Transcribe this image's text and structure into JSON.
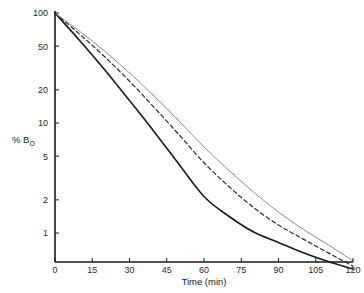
{
  "chart_data": {
    "type": "line",
    "title": "",
    "subtitle": "",
    "xlabel": "Time (min)",
    "ylabel": "% B",
    "ylabel_subscript": "O",
    "ylabel_full": "% B_O",
    "yscale": "log",
    "xscale": "linear",
    "xlim": [
      0,
      120
    ],
    "ylim": [
      0.45,
      100
    ],
    "grid": false,
    "legend": "none",
    "xticks": [
      0,
      15,
      30,
      45,
      60,
      75,
      90,
      105,
      120
    ],
    "xticklabels": [
      "0",
      "15",
      "30",
      "45",
      "60",
      "75",
      "90",
      "105",
      "120"
    ],
    "yticks": [
      100,
      50,
      20,
      10,
      5,
      2,
      1
    ],
    "yticklabels": [
      "100",
      "50",
      "20",
      "10",
      "5",
      "2",
      "1"
    ],
    "x": [
      0,
      10,
      20,
      30,
      40,
      50,
      60,
      70,
      80,
      90,
      100,
      110,
      120
    ],
    "series": [
      {
        "name": "curve-fast",
        "style": "solid",
        "color": "#1a1a1a",
        "width": 1.6,
        "values": [
          100,
          56,
          30.5,
          16.0,
          8.3,
          4.2,
          2.15,
          1.42,
          1.02,
          0.82,
          0.66,
          0.55,
          0.47
        ]
      },
      {
        "name": "curve-medium",
        "style": "dashed",
        "color": "#2b2b2b",
        "width": 1.2,
        "values": [
          100,
          64,
          40.0,
          24.0,
          13.8,
          7.8,
          4.35,
          2.65,
          1.7,
          1.18,
          0.88,
          0.66,
          0.5
        ]
      },
      {
        "name": "curve-slow",
        "style": "solid",
        "color": "#8a8a8a",
        "width": 1.0,
        "values": [
          100,
          68,
          45.0,
          28.5,
          17.5,
          10.4,
          6.05,
          3.72,
          2.35,
          1.55,
          1.08,
          0.78,
          0.56
        ]
      }
    ],
    "annotations": []
  },
  "axes": {
    "x_axis_name": "x-axis",
    "y_axis_name": "y-axis"
  }
}
